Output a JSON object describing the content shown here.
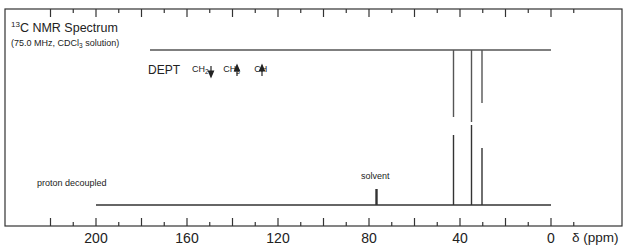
{
  "chart_data": {
    "type": "line",
    "title": "13C NMR Spectrum",
    "subtitle": "(75.0 MHz, CDCl3 solution)",
    "xlabel": "δ (ppm)",
    "ylabel": "",
    "xlim": [
      220,
      -10
    ],
    "x_reversed": true,
    "x_ticks": [
      200,
      160,
      120,
      80,
      40,
      0
    ],
    "grid": false,
    "series": [
      {
        "name": "DEPT",
        "legend": [
          "CH2 ↓",
          "CH3 ↑",
          "CH ↑"
        ],
        "baseline_range": [
          180,
          0
        ],
        "peaks": [
          {
            "ppm": 43,
            "direction": "down",
            "relative_height": 0.67
          },
          {
            "ppm": 35,
            "direction": "down",
            "relative_height": 0.72
          },
          {
            "ppm": 30.5,
            "direction": "down",
            "relative_height": 0.52
          }
        ]
      },
      {
        "name": "proton decoupled",
        "baseline_range": [
          200,
          0
        ],
        "peaks": [
          {
            "ppm": 77,
            "label": "solvent",
            "relative_height": 0.2
          },
          {
            "ppm": 43,
            "relative_height": 0.87
          },
          {
            "ppm": 35,
            "relative_height": 1.0
          },
          {
            "ppm": 30.5,
            "relative_height": 0.72
          }
        ]
      }
    ]
  },
  "labels": {
    "title_sup": "13",
    "title_main": "C NMR Spectrum",
    "sub_a": "(75.0 MHz, CDCl",
    "sub_b": "3",
    "sub_c": " solution)",
    "dept": "DEPT",
    "ch2": "CH",
    "ch2_sub": "2",
    "ch3": "CH",
    "ch3_sub": "3",
    "ch": "CH",
    "proton_decoupled": "proton decoupled",
    "solvent": "solvent",
    "xlabel": "δ (ppm)",
    "ticks": [
      "200",
      "160",
      "120",
      "80",
      "40",
      "0"
    ]
  }
}
